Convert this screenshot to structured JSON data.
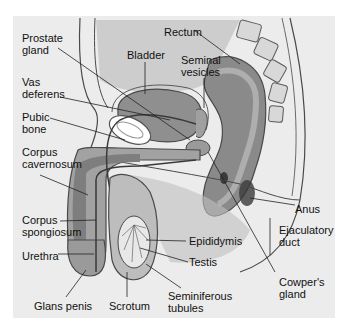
{
  "figure": {
    "colors": {
      "background": "#ffffff",
      "panel": "#ececec",
      "tissue_dark": "#8a8a8a",
      "tissue_mid": "#a8a8a8",
      "tissue_light": "#c8c8c8",
      "outline": "#4a4a4a",
      "leader": "#222222"
    }
  },
  "labels": [
    {
      "id": "prostate-gland",
      "text1": "Prostate",
      "text2": "gland"
    },
    {
      "id": "bladder",
      "text1": "Bladder"
    },
    {
      "id": "rectum",
      "text1": "Rectum"
    },
    {
      "id": "seminal-vesicles",
      "text1": "Seminal",
      "text2": "vesicles"
    },
    {
      "id": "vas-deferens",
      "text1": "Vas",
      "text2": "deferens"
    },
    {
      "id": "pubic-bone",
      "text1": "Pubic",
      "text2": "bone"
    },
    {
      "id": "corpus-cavernosum",
      "text1": "Corpus",
      "text2": "cavernosum"
    },
    {
      "id": "corpus-spongiosum",
      "text1": "Corpus",
      "text2": "spongiosum"
    },
    {
      "id": "urethra",
      "text1": "Urethra"
    },
    {
      "id": "glans-penis",
      "text1": "Glans penis"
    },
    {
      "id": "scrotum",
      "text1": "Scrotum"
    },
    {
      "id": "seminiferous-tubules",
      "text1": "Seminiferous",
      "text2": "tubules"
    },
    {
      "id": "epididymis",
      "text1": "Epididymis"
    },
    {
      "id": "testis",
      "text1": "Testis"
    },
    {
      "id": "anus",
      "text1": "Anus"
    },
    {
      "id": "ejaculatory-duct",
      "text1": "Ejaculatory",
      "text2": "duct"
    },
    {
      "id": "cowpers-gland",
      "text1": "Cowper's",
      "text2": "gland"
    }
  ]
}
